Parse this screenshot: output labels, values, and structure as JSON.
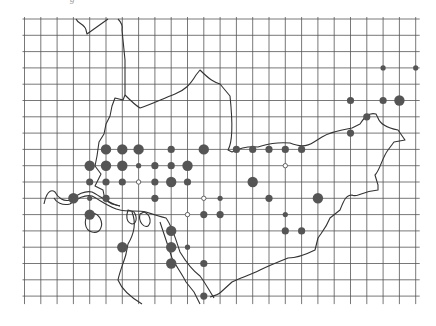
{
  "caption": "g",
  "map": {
    "type": "grid-dot-distribution-map",
    "grid": {
      "x0": 24.5,
      "y0": 19,
      "step": 16.3,
      "cols": 24,
      "rows": 17,
      "overhang": 8,
      "color": "#555555"
    },
    "boundary_color": "#333333",
    "dot_color": "#555555",
    "dot_sizes": {
      "S": 2.6,
      "M": 3.6,
      "L": 5.2
    },
    "legend_note": "filled dots = occurrence (size by abundance), open dots = hollow marker",
    "dots": [
      {
        "c": 22,
        "r": 3,
        "s": "S"
      },
      {
        "c": 24,
        "r": 3,
        "s": "S"
      },
      {
        "c": 20,
        "r": 5,
        "s": "M"
      },
      {
        "c": 22,
        "r": 5,
        "s": "M"
      },
      {
        "c": 23,
        "r": 5,
        "s": "L"
      },
      {
        "c": 21,
        "r": 6,
        "s": "M"
      },
      {
        "c": 20,
        "r": 7,
        "s": "M"
      },
      {
        "c": 5,
        "r": 8,
        "s": "L"
      },
      {
        "c": 6,
        "r": 8,
        "s": "L"
      },
      {
        "c": 7,
        "r": 8,
        "s": "L"
      },
      {
        "c": 9,
        "r": 8,
        "s": "M"
      },
      {
        "c": 11,
        "r": 8,
        "s": "L"
      },
      {
        "c": 13,
        "r": 8,
        "s": "M"
      },
      {
        "c": 14,
        "r": 8,
        "s": "M"
      },
      {
        "c": 15,
        "r": 8,
        "s": "M"
      },
      {
        "c": 16,
        "r": 8,
        "s": "M"
      },
      {
        "c": 17,
        "r": 8,
        "s": "M"
      },
      {
        "c": 4,
        "r": 9,
        "s": "L"
      },
      {
        "c": 5,
        "r": 9,
        "s": "L"
      },
      {
        "c": 6,
        "r": 9,
        "s": "L"
      },
      {
        "c": 7,
        "r": 9,
        "s": "S"
      },
      {
        "c": 8,
        "r": 9,
        "s": "M"
      },
      {
        "c": 9,
        "r": 9,
        "s": "M"
      },
      {
        "c": 10,
        "r": 9,
        "s": "L"
      },
      {
        "c": 16,
        "r": 9,
        "s": "O"
      },
      {
        "c": 4,
        "r": 10,
        "s": "M"
      },
      {
        "c": 5,
        "r": 10,
        "s": "M"
      },
      {
        "c": 6,
        "r": 10,
        "s": "M"
      },
      {
        "c": 7,
        "r": 10,
        "s": "O"
      },
      {
        "c": 8,
        "r": 10,
        "s": "M"
      },
      {
        "c": 9,
        "r": 10,
        "s": "L"
      },
      {
        "c": 10,
        "r": 10,
        "s": "M"
      },
      {
        "c": 14,
        "r": 10,
        "s": "L"
      },
      {
        "c": 3,
        "r": 11,
        "s": "L"
      },
      {
        "c": 4,
        "r": 11,
        "s": "S"
      },
      {
        "c": 5,
        "r": 11,
        "s": "M"
      },
      {
        "c": 8,
        "r": 11,
        "s": "M"
      },
      {
        "c": 11,
        "r": 11,
        "s": "O"
      },
      {
        "c": 12,
        "r": 11,
        "s": "S"
      },
      {
        "c": 15,
        "r": 11,
        "s": "M"
      },
      {
        "c": 18,
        "r": 11,
        "s": "L"
      },
      {
        "c": 4,
        "r": 12,
        "s": "L"
      },
      {
        "c": 10,
        "r": 12,
        "s": "O"
      },
      {
        "c": 11,
        "r": 12,
        "s": "M"
      },
      {
        "c": 12,
        "r": 12,
        "s": "M"
      },
      {
        "c": 16,
        "r": 12,
        "s": "S"
      },
      {
        "c": 9,
        "r": 13,
        "s": "L"
      },
      {
        "c": 16,
        "r": 13,
        "s": "M"
      },
      {
        "c": 17,
        "r": 13,
        "s": "M"
      },
      {
        "c": 6,
        "r": 14,
        "s": "L"
      },
      {
        "c": 9,
        "r": 14,
        "s": "L"
      },
      {
        "c": 10,
        "r": 14,
        "s": "S"
      },
      {
        "c": 9,
        "r": 15,
        "s": "L"
      },
      {
        "c": 11,
        "r": 15,
        "s": "M"
      },
      {
        "c": 11,
        "r": 17,
        "s": "M"
      }
    ]
  }
}
